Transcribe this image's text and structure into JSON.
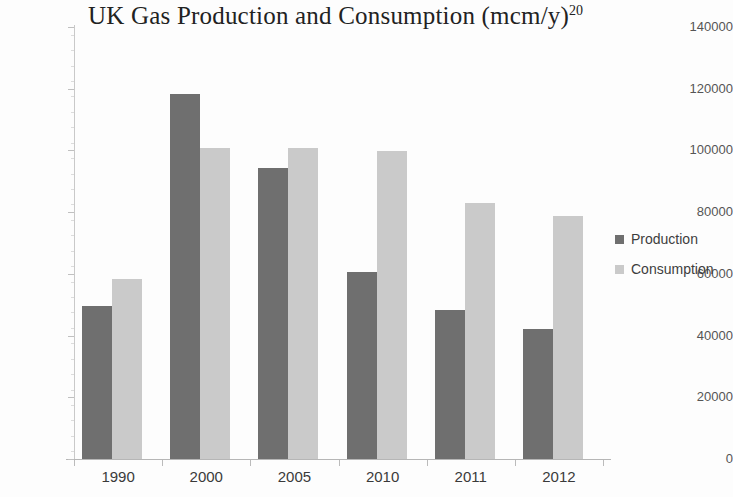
{
  "chart_data": {
    "type": "bar",
    "title": "UK Gas Production and Consumption (mcm/y)",
    "title_superscript": "20",
    "xlabel": "",
    "ylabel": "",
    "categories": [
      "1990",
      "2000",
      "2005",
      "2010",
      "2011",
      "2012"
    ],
    "series": [
      {
        "name": "Production",
        "color": "#6f6f6f",
        "values": [
          49600,
          118400,
          94300,
          60600,
          48300,
          42100
        ]
      },
      {
        "name": "Consumption",
        "color": "#cacaca",
        "values": [
          58500,
          100800,
          100800,
          99900,
          83000,
          78900
        ]
      }
    ],
    "ylim": [
      0,
      140000
    ],
    "ytick_values": [
      0,
      20000,
      40000,
      60000,
      80000,
      100000,
      120000,
      140000
    ],
    "ytick_labels": [
      "0",
      "20000",
      "40000",
      "60000",
      "80000",
      "100000",
      "120000",
      "140000"
    ],
    "grid": false,
    "legend_position": "right",
    "legend_entries": [
      "Production",
      "Consumption"
    ]
  }
}
